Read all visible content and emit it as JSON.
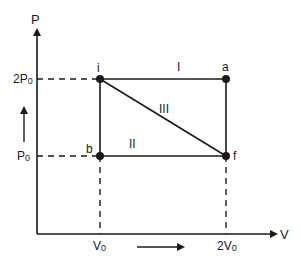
{
  "diagram": {
    "type": "PV thermodynamic process diagram",
    "axes": {
      "y_label": "P",
      "x_label": "V",
      "y_ticks": [
        {
          "main": "2P",
          "sub": "0"
        },
        {
          "main": "P",
          "sub": "0"
        }
      ],
      "x_ticks": [
        {
          "main": "V",
          "sub": "0"
        },
        {
          "main": "2V",
          "sub": "0"
        }
      ]
    },
    "points": {
      "i": "i",
      "a": "a",
      "b": "b",
      "f": "f"
    },
    "paths": {
      "I": "I",
      "II": "II",
      "III": "III"
    },
    "colors": {
      "line": "#1a1a1a",
      "background": "#ffffff"
    }
  }
}
